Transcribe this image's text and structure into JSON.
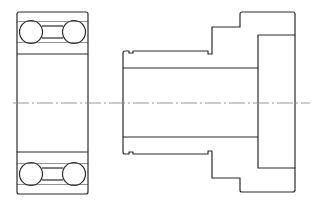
{
  "drawing": {
    "title": "Bearing and stepped shaft sleeve — sectional view",
    "colors": {
      "line": "#2a2a2a",
      "hatch": "#555555",
      "centerline": "#8a8a8a",
      "background": "#ffffff"
    },
    "parts": [
      {
        "name": "double-row ball bearing",
        "view": "section"
      },
      {
        "name": "stepped hollow shaft / sleeve",
        "view": "section"
      }
    ],
    "centerline": {
      "y": 103,
      "x_start": 13,
      "x_end": 310
    }
  }
}
